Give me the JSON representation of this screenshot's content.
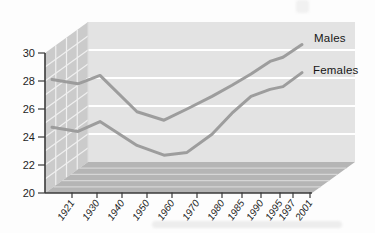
{
  "chart_data": {
    "type": "line",
    "style": "3d-perspective-walls",
    "title": "",
    "xlabel": "",
    "ylabel": "",
    "categories": [
      "1921",
      "1930",
      "1940",
      "1950",
      "1960",
      "1970",
      "1980",
      "1985",
      "1990",
      "1995",
      "1997",
      "2001"
    ],
    "series": [
      {
        "name": "Males",
        "values": [
          28.1,
          27.8,
          28.4,
          25.8,
          25.2,
          26.0,
          26.9,
          27.7,
          28.5,
          29.4,
          29.7,
          30.6
        ]
      },
      {
        "name": "Females",
        "values": [
          24.7,
          24.4,
          25.1,
          23.4,
          22.7,
          22.9,
          24.2,
          25.7,
          26.9,
          27.4,
          27.6,
          28.6
        ]
      }
    ],
    "ylim": [
      20,
      30
    ],
    "yticks": [
      20,
      22,
      24,
      26,
      28,
      30
    ],
    "grid": true,
    "legend_position": "right-of-line-ends",
    "colors": {
      "line": "#999999",
      "back_wall": "#e3e3e3",
      "side_wall": "#cbcbcb",
      "floor": "#b5b5b5",
      "wall_gridline": "#ffffff",
      "side_gridline": "#f0f0f0",
      "floor_gridline": "#d6d6d6",
      "axis": "#3a3a3a",
      "text": "#1f1f1f"
    }
  }
}
